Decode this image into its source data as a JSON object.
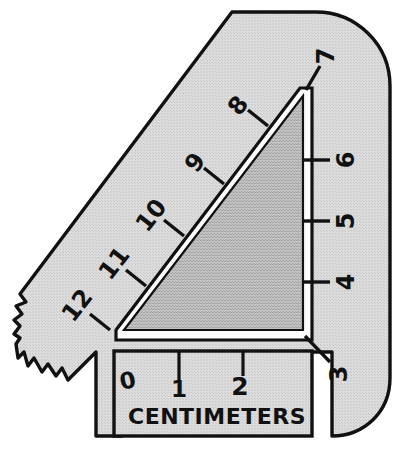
{
  "figure": {
    "caption_text": "CENTIMETERS",
    "colors": {
      "page_background": "#ffffff",
      "body_fill": "#d4d4d4",
      "triangle_fill": "#b8b8b8",
      "outline": "#111111",
      "gap_highlight": "#ffffff"
    }
  },
  "diagonal_scale": {
    "name": "diagonal-hypotenuse-scale",
    "labels": [
      "8",
      "9",
      "10",
      "11",
      "12"
    ],
    "tick_count": 5
  },
  "vertical_scale": {
    "name": "vertical-right-scale",
    "labels": [
      "7",
      "6",
      "5",
      "4",
      "3"
    ],
    "tick_count": 3,
    "tick_labels": [
      "6",
      "5",
      "4"
    ],
    "endpoint_labels": [
      "7",
      "3"
    ]
  },
  "horizontal_ruler": {
    "name": "centimeter-ruler",
    "labels": [
      "0",
      "1",
      "2"
    ],
    "unit_label": "CENTIMETERS",
    "tick_labels": [
      "1",
      "2"
    ]
  }
}
